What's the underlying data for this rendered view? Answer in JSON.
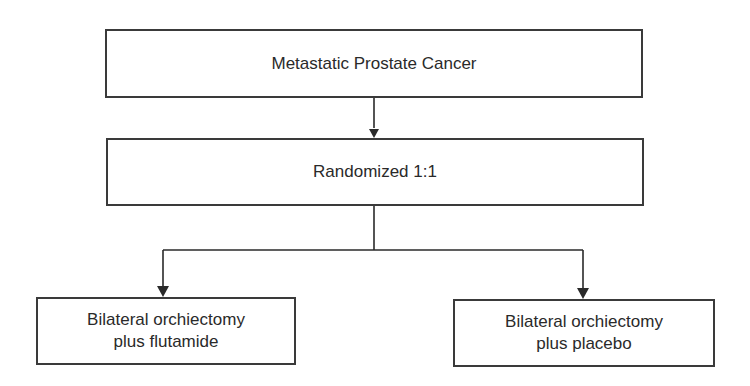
{
  "diagram": {
    "type": "flowchart",
    "nodes": {
      "top": {
        "label": "Metastatic Prostate Cancer"
      },
      "random": {
        "label": "Randomized 1:1"
      },
      "left": {
        "lines": [
          "Bilateral orchiectomy",
          "plus flutamide"
        ]
      },
      "right": {
        "lines": [
          "Bilateral orchiectomy",
          "plus placebo"
        ]
      }
    },
    "edges": [
      {
        "from": "top",
        "to": "random"
      },
      {
        "from": "random",
        "to": "left"
      },
      {
        "from": "random",
        "to": "right"
      }
    ],
    "colors": {
      "stroke": "#3a3a3a",
      "text": "#2a2a2a",
      "background": "#ffffff"
    }
  }
}
